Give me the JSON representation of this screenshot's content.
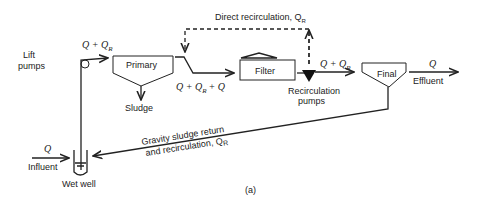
{
  "labels": {
    "direct_recirc": "Direct recirculation, Q",
    "direct_recirc_sub": "R",
    "lift_pumps_1": "Lift",
    "lift_pumps_2": "pumps",
    "q_qr_1": "Q + Q",
    "q_qr_1_sub": "R",
    "primary": "Primary",
    "sludge": "Sludge",
    "q_qr_qr2": "Q + Q",
    "q_qr_qr2_sub": "R",
    "q_qr_qr2_tail": "+ Q",
    "filter": "Filter",
    "q_qr_2": "Q + Q",
    "recirc_pumps_1": "Recirculation",
    "recirc_pumps_2": "pumps",
    "final": "Final",
    "q_eff": "Q",
    "effluent": "Effluent",
    "gravity_1": "Gravity sludge return",
    "gravity_2": "and recirculation, Q",
    "q_inf": "Q",
    "influent": "Influent",
    "wet_well": "Wet well",
    "caption": "(a)"
  }
}
